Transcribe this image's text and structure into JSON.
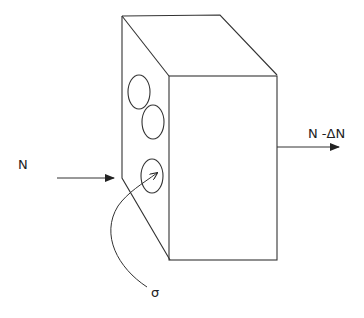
{
  "diagram": {
    "labels": {
      "input_force": "N",
      "output_force": "N -ΔN",
      "stress": "σ"
    },
    "colors": {
      "stroke": "#333333",
      "background": "#ffffff"
    }
  }
}
